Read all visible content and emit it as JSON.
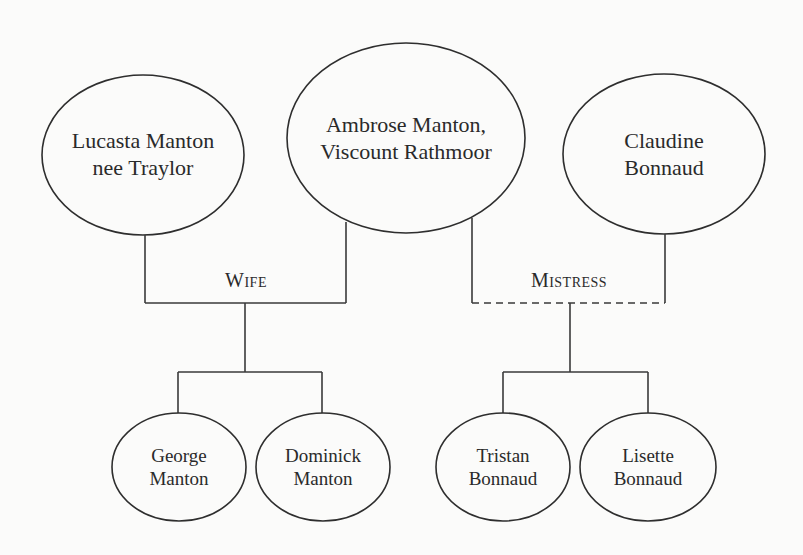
{
  "diagram": {
    "type": "family-tree",
    "colors": {
      "background": "#fbfbfa",
      "stroke": "#2e2e2e",
      "text": "#2a2a2a"
    },
    "parents": [
      {
        "id": "lucasta",
        "lines": [
          "Lucasta Manton",
          "nee Traylor"
        ],
        "cx": 143,
        "cy": 155,
        "rx": 101,
        "ry": 80
      },
      {
        "id": "ambrose",
        "lines": [
          "Ambrose Manton,",
          "Viscount Rathmoor"
        ],
        "cx": 406,
        "cy": 138,
        "rx": 119,
        "ry": 95
      },
      {
        "id": "claudine",
        "lines": [
          "Claudine",
          "Bonnaud"
        ],
        "cx": 664,
        "cy": 154,
        "rx": 101,
        "ry": 80
      }
    ],
    "relationships": [
      {
        "id": "wife",
        "label": "Wife",
        "style": "solid",
        "from": "ambrose",
        "to": "lucasta",
        "label_x": 246,
        "label_y": 280
      },
      {
        "id": "mistress",
        "label": "Mistress",
        "style": "dashed",
        "from": "ambrose",
        "to": "claudine",
        "label_x": 569,
        "label_y": 280
      }
    ],
    "children": [
      {
        "id": "george",
        "lines": [
          "George",
          "Manton"
        ],
        "of": "wife",
        "cx": 179,
        "cy": 467,
        "rx": 67,
        "ry": 54
      },
      {
        "id": "dominick",
        "lines": [
          "Dominick",
          "Manton"
        ],
        "of": "wife",
        "cx": 323,
        "cy": 467,
        "rx": 67,
        "ry": 54
      },
      {
        "id": "tristan",
        "lines": [
          "Tristan",
          "Bonnaud"
        ],
        "of": "mistress",
        "cx": 503,
        "cy": 467,
        "rx": 67,
        "ry": 54
      },
      {
        "id": "lisette",
        "lines": [
          "Lisette",
          "Bonnaud"
        ],
        "of": "mistress",
        "cx": 648,
        "cy": 467,
        "rx": 68,
        "ry": 54
      }
    ]
  }
}
